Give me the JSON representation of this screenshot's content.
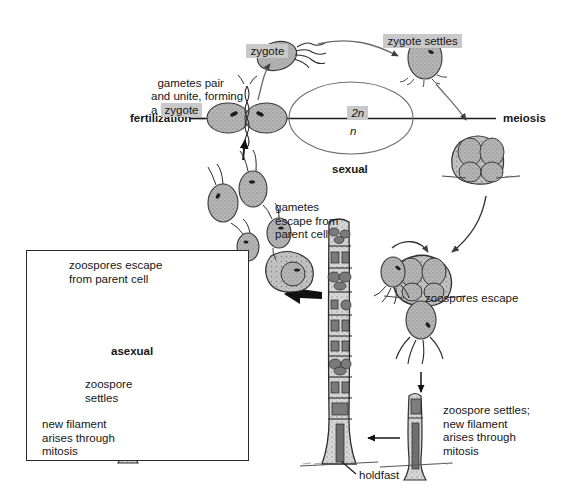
{
  "diagram": {
    "type": "biological-life-cycle-diagram",
    "background_color": "#ffffff",
    "ink_color": "#1a1a1a",
    "highlight_color": "#c9c9c9"
  },
  "axis": {
    "left_label": "fertilization",
    "right_label": "meiosis",
    "divider_note": "horizontal line separating 2n (above) from n (below)"
  },
  "ploidy": {
    "diploid": "2n",
    "haploid": "n",
    "cycle_label": "sexual"
  },
  "labels": {
    "gametes_pair": "gametes pair\nand unite, forming\na ",
    "gametes_pair_highlight": "zygote",
    "zygote": "zygote",
    "zygote_settles": "zygote settles",
    "gametes_escape": "gametes\nescape from\nparent cell",
    "zoospores_escape": "zoospores escape",
    "zoospore_settles_right": "zoospore settles;\nnew filament\narises through\nmitosis",
    "holdfast": "holdfast"
  },
  "inset": {
    "cycle_label": "asexual",
    "zoospores_escape": "zoospores escape\nfrom parent cell",
    "zoospore_settles": "zoospore\nsettles",
    "new_filament": "new filament\narises through\nmitosis"
  },
  "organisms": [
    {
      "name": "zygote-flagellated",
      "position": "top-center"
    },
    {
      "name": "zygote-settled",
      "position": "top-right"
    },
    {
      "name": "fused-gametes-pair",
      "position": "left-axis"
    },
    {
      "name": "meiosis-sporangium",
      "position": "right-upper"
    },
    {
      "name": "zoospore-sporangium",
      "position": "right-mid"
    },
    {
      "name": "zoospore-flagellated",
      "position": "right-lower"
    },
    {
      "name": "young-filament",
      "position": "bottom-right"
    },
    {
      "name": "parent-filament",
      "position": "center-bottom"
    },
    {
      "name": "gamete-swarm",
      "position": "center-left"
    }
  ]
}
